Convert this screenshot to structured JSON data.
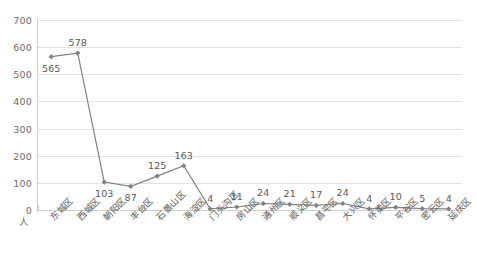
{
  "chart_data": {
    "type": "line",
    "title": "",
    "xlabel": "",
    "ylabel": "",
    "unit_label": "人",
    "ylim": [
      0,
      700
    ],
    "ytick_step": 100,
    "yticks": [
      0,
      100,
      200,
      300,
      400,
      500,
      600,
      700
    ],
    "ytick_labels": [
      "0",
      "100",
      "200",
      "300",
      "400",
      "500",
      "600",
      "700"
    ],
    "grid": true,
    "legend": "none",
    "series_color": "#808080",
    "marker": "diamond",
    "categories": [
      "东城区",
      "西城区",
      "朝阳区",
      "丰台区",
      "石景山区",
      "海淀区",
      "门头沟区",
      "房山区",
      "通州区",
      "顺义区",
      "昌平区",
      "大兴区",
      "怀柔区",
      "平谷区",
      "密云区",
      "延庆区"
    ],
    "values": [
      565,
      578,
      103,
      87,
      125,
      163,
      4,
      11,
      24,
      21,
      17,
      24,
      4,
      10,
      5,
      4
    ],
    "data_labels": [
      "565",
      "578",
      "103",
      "87",
      "125",
      "163",
      "4",
      "11",
      "24",
      "21",
      "17",
      "24",
      "4",
      "10",
      "5",
      "4"
    ],
    "data_label_positions": [
      "below",
      "above",
      "below",
      "below",
      "above",
      "above",
      "above",
      "above",
      "above",
      "above",
      "above",
      "above",
      "above",
      "above",
      "above",
      "above"
    ]
  }
}
